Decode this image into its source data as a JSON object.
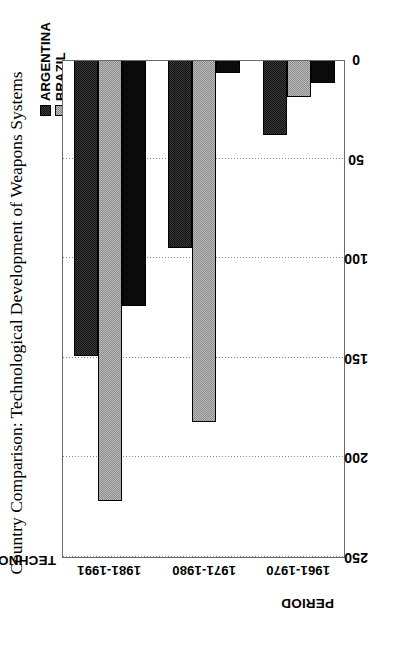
{
  "chart_data": {
    "type": "bar",
    "orientation": "horizontal-rotated",
    "title": "Country Comparison: Technological Development of Weapons Systems",
    "xlabel": "PERIOD",
    "ylabel": "TECHNOLOGY MERIT INDEX",
    "categories": [
      "1961-1970",
      "1971-1980",
      "1981-1991"
    ],
    "series": [
      {
        "name": "ARGENTINA",
        "values": [
          38,
          95,
          149
        ],
        "color": "#3a3a3a",
        "pattern": "dark-dither"
      },
      {
        "name": "BRAZIL",
        "values": [
          19,
          182,
          222
        ],
        "color": "#b9b9b9",
        "pattern": "light-dither"
      },
      {
        "name": "CHILE",
        "values": [
          12,
          7,
          124
        ],
        "color": "#0b0b0b",
        "pattern": "solid"
      }
    ],
    "ylim": [
      0,
      250
    ],
    "yticks": [
      250,
      200,
      150,
      100,
      50,
      0
    ],
    "grid": true,
    "grid_axis": "value",
    "legend_position": "top-right",
    "legend_entries": [
      "ARGENTINA",
      "BRAZIL",
      "CHILE"
    ]
  },
  "figure": {
    "title": "Country Comparison: Technological Development of Weapons Systems",
    "value_axis_title": "TECHNOLOGY MERIT INDEX",
    "category_axis_title": "PERIOD"
  },
  "legend": {
    "items": [
      {
        "label": "ARGENTINA",
        "swatch": "argentina-swatch-icon"
      },
      {
        "label": "BRAZIL",
        "swatch": "brazil-swatch-icon"
      },
      {
        "label": "CHILE",
        "swatch": "chile-swatch-icon"
      }
    ]
  },
  "axes": {
    "value_ticks": [
      "250",
      "200",
      "150",
      "100",
      "50",
      "0"
    ],
    "category_ticks": [
      "1961-1970",
      "1971-1980",
      "1981-1991"
    ]
  }
}
